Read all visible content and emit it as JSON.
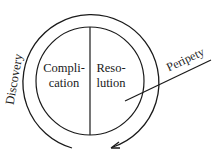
{
  "diagram": {
    "type": "concept-circle",
    "inner_left_label": [
      "Compli-",
      "cation"
    ],
    "inner_right_label": [
      "Reso-",
      "lution"
    ],
    "outer_arc_label": "Discovery",
    "pointer_label": "Peripety",
    "colors": {
      "stroke": "#1a1a1a",
      "background": "#ffffff"
    }
  }
}
